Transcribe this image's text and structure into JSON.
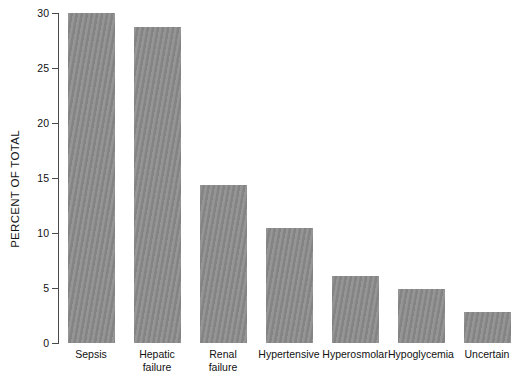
{
  "chart_data": {
    "type": "bar",
    "title": "",
    "xlabel": "",
    "ylabel": "PERCENT OF TOTAL",
    "ylim": [
      0,
      30
    ],
    "yticks": [
      0,
      5,
      10,
      15,
      20,
      25,
      30
    ],
    "ytick_labels": [
      "0",
      "5",
      "10",
      "15",
      "20",
      "25",
      "30"
    ],
    "grid": false,
    "legend": null,
    "bar_color": "#8b8b8b",
    "background_color": "#ffffff",
    "axis_color": "#4a4a4a",
    "categories": [
      "Sepsis",
      "Hepatic failure",
      "Renal failure",
      "Hypertensive",
      "Hyperosmolar",
      "Hypoglycemia",
      "Uncertain"
    ],
    "category_lines": [
      [
        "Sepsis"
      ],
      [
        "Hepatic",
        "failure"
      ],
      [
        "Renal",
        "failure"
      ],
      [
        "Hypertensive"
      ],
      [
        "Hyperosmolar"
      ],
      [
        "Hypoglycemia"
      ],
      [
        "Uncertain"
      ]
    ],
    "values": [
      30.0,
      28.7,
      14.4,
      10.5,
      6.1,
      4.9,
      2.8
    ]
  }
}
